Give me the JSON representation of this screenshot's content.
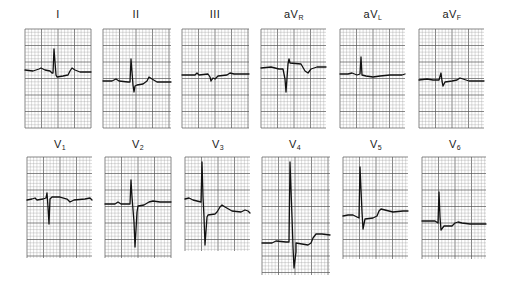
{
  "figure": {
    "colors": {
      "background": "#ffffff",
      "grid_minor": "#9a9a9a",
      "grid_major": "#555555",
      "trace": "#111111"
    },
    "grid": {
      "small_square_px": 3.3,
      "major_every": 5
    }
  },
  "leads": [
    {
      "id": "I",
      "label": "I",
      "sub": "",
      "x": 25,
      "y": 29,
      "w": 66,
      "h": 99,
      "label_x": 28,
      "label_y": 8,
      "trace": [
        [
          0,
          41
        ],
        [
          8,
          42
        ],
        [
          14,
          40
        ],
        [
          16,
          39
        ],
        [
          20,
          41
        ],
        [
          25,
          42
        ],
        [
          27,
          44
        ],
        [
          28,
          44
        ],
        [
          29,
          20
        ],
        [
          31,
          46
        ],
        [
          32,
          48
        ],
        [
          38,
          47
        ],
        [
          43,
          46
        ],
        [
          45,
          42
        ],
        [
          47,
          39
        ],
        [
          50,
          41
        ],
        [
          55,
          43
        ],
        [
          66,
          43
        ]
      ]
    },
    {
      "id": "II",
      "label": "II",
      "sub": "",
      "x": 103,
      "y": 29,
      "w": 68,
      "h": 99,
      "label_x": 106,
      "label_y": 8,
      "trace": [
        [
          0,
          52
        ],
        [
          9,
          52
        ],
        [
          13,
          50
        ],
        [
          16,
          52
        ],
        [
          25,
          53
        ],
        [
          27,
          53
        ],
        [
          28,
          30
        ],
        [
          30,
          56
        ],
        [
          31,
          63
        ],
        [
          32,
          57
        ],
        [
          34,
          56
        ],
        [
          40,
          55
        ],
        [
          44,
          52
        ],
        [
          46,
          48
        ],
        [
          49,
          50
        ],
        [
          54,
          53
        ],
        [
          68,
          53
        ]
      ]
    },
    {
      "id": "III",
      "label": "III",
      "sub": "",
      "x": 182,
      "y": 29,
      "w": 67,
      "h": 99,
      "label_x": 185,
      "label_y": 8,
      "trace": [
        [
          0,
          46
        ],
        [
          13,
          46
        ],
        [
          15,
          44
        ],
        [
          17,
          46
        ],
        [
          26,
          45
        ],
        [
          28,
          48
        ],
        [
          29,
          52
        ],
        [
          31,
          49
        ],
        [
          33,
          50
        ],
        [
          36,
          47
        ],
        [
          45,
          46
        ],
        [
          48,
          44
        ],
        [
          52,
          45
        ],
        [
          67,
          45
        ]
      ]
    },
    {
      "id": "aVR",
      "label": "aV",
      "sub": "R",
      "x": 261,
      "y": 29,
      "w": 65,
      "h": 99,
      "label_x": 264,
      "label_y": 8,
      "trace": [
        [
          0,
          39
        ],
        [
          10,
          38
        ],
        [
          14,
          39
        ],
        [
          18,
          40
        ],
        [
          22,
          40
        ],
        [
          24,
          50
        ],
        [
          25,
          63
        ],
        [
          27,
          35
        ],
        [
          28,
          30
        ],
        [
          29,
          34
        ],
        [
          40,
          35
        ],
        [
          44,
          42
        ],
        [
          47,
          44
        ],
        [
          50,
          40
        ],
        [
          56,
          38
        ],
        [
          65,
          38
        ]
      ]
    },
    {
      "id": "aVL",
      "label": "aV",
      "sub": "L",
      "x": 340,
      "y": 29,
      "w": 65,
      "h": 99,
      "label_x": 343,
      "label_y": 8,
      "trace": [
        [
          0,
          45
        ],
        [
          8,
          45
        ],
        [
          12,
          44
        ],
        [
          17,
          46
        ],
        [
          20,
          45
        ],
        [
          21,
          28
        ],
        [
          22,
          46
        ],
        [
          26,
          47
        ],
        [
          33,
          48
        ],
        [
          40,
          47
        ],
        [
          50,
          46
        ],
        [
          62,
          46
        ],
        [
          65,
          45
        ]
      ]
    },
    {
      "id": "aVF",
      "label": "aV",
      "sub": "F",
      "x": 419,
      "y": 29,
      "w": 65,
      "h": 99,
      "label_x": 422,
      "label_y": 8,
      "trace": [
        [
          0,
          51
        ],
        [
          8,
          50
        ],
        [
          14,
          51
        ],
        [
          20,
          51
        ],
        [
          22,
          44
        ],
        [
          23,
          52
        ],
        [
          24,
          57
        ],
        [
          26,
          53
        ],
        [
          33,
          52
        ],
        [
          38,
          51
        ],
        [
          41,
          49
        ],
        [
          44,
          50
        ],
        [
          50,
          52
        ],
        [
          65,
          52
        ]
      ]
    },
    {
      "id": "V1",
      "label": "V",
      "sub": "1",
      "x": 27,
      "y": 157,
      "w": 65,
      "h": 101,
      "label_x": 30,
      "label_y": 138,
      "trace": [
        [
          0,
          43
        ],
        [
          5,
          42
        ],
        [
          8,
          41
        ],
        [
          10,
          43
        ],
        [
          16,
          42
        ],
        [
          19,
          41
        ],
        [
          20,
          36
        ],
        [
          21,
          50
        ],
        [
          22,
          67
        ],
        [
          23,
          42
        ],
        [
          25,
          40
        ],
        [
          33,
          40
        ],
        [
          40,
          42
        ],
        [
          43,
          45
        ],
        [
          47,
          43
        ],
        [
          58,
          42
        ],
        [
          63,
          41
        ],
        [
          65,
          43
        ]
      ]
    },
    {
      "id": "V2",
      "label": "V",
      "sub": "2",
      "x": 105,
      "y": 157,
      "w": 66,
      "h": 101,
      "label_x": 108,
      "label_y": 138,
      "trace": [
        [
          0,
          47
        ],
        [
          10,
          47
        ],
        [
          13,
          45
        ],
        [
          16,
          47
        ],
        [
          25,
          47
        ],
        [
          26,
          23
        ],
        [
          27,
          40
        ],
        [
          29,
          65
        ],
        [
          30,
          90
        ],
        [
          32,
          55
        ],
        [
          33,
          49
        ],
        [
          39,
          48
        ],
        [
          44,
          45
        ],
        [
          48,
          44
        ],
        [
          55,
          45
        ],
        [
          66,
          45
        ]
      ]
    },
    {
      "id": "V3",
      "label": "V",
      "sub": "3",
      "x": 185,
      "y": 157,
      "w": 65,
      "h": 94,
      "label_x": 188,
      "label_y": 138,
      "trace": [
        [
          0,
          42
        ],
        [
          4,
          41
        ],
        [
          8,
          43
        ],
        [
          16,
          45
        ],
        [
          17,
          5
        ],
        [
          18,
          40
        ],
        [
          19,
          60
        ],
        [
          20,
          88
        ],
        [
          22,
          60
        ],
        [
          23,
          58
        ],
        [
          30,
          57
        ],
        [
          32,
          55
        ],
        [
          35,
          50
        ],
        [
          37,
          48
        ],
        [
          40,
          50
        ],
        [
          47,
          54
        ],
        [
          56,
          55
        ],
        [
          60,
          53
        ],
        [
          63,
          54
        ],
        [
          65,
          56
        ]
      ]
    },
    {
      "id": "V4",
      "label": "V",
      "sub": "4",
      "x": 262,
      "y": 157,
      "w": 68,
      "h": 118,
      "label_x": 265,
      "label_y": 138,
      "trace": [
        [
          0,
          86
        ],
        [
          10,
          86
        ],
        [
          14,
          84
        ],
        [
          24,
          85
        ],
        [
          27,
          85
        ],
        [
          28,
          5
        ],
        [
          30,
          60
        ],
        [
          31,
          90
        ],
        [
          32,
          111
        ],
        [
          34,
          95
        ],
        [
          34,
          86
        ],
        [
          40,
          87
        ],
        [
          46,
          88
        ],
        [
          49,
          86
        ],
        [
          51,
          81
        ],
        [
          54,
          77
        ],
        [
          60,
          77
        ],
        [
          68,
          78
        ]
      ]
    },
    {
      "id": "V5",
      "label": "V",
      "sub": "5",
      "x": 343,
      "y": 157,
      "w": 65,
      "h": 102,
      "label_x": 346,
      "label_y": 138,
      "trace": [
        [
          0,
          59
        ],
        [
          5,
          58
        ],
        [
          10,
          58
        ],
        [
          16,
          61
        ],
        [
          17,
          10
        ],
        [
          19,
          55
        ],
        [
          20,
          72
        ],
        [
          22,
          62
        ],
        [
          30,
          61
        ],
        [
          34,
          59
        ],
        [
          36,
          54
        ],
        [
          38,
          52
        ],
        [
          42,
          53
        ],
        [
          50,
          55
        ],
        [
          60,
          54
        ],
        [
          65,
          54
        ]
      ]
    },
    {
      "id": "V6",
      "label": "V",
      "sub": "6",
      "x": 422,
      "y": 157,
      "w": 64,
      "h": 102,
      "label_x": 425,
      "label_y": 138,
      "trace": [
        [
          0,
          64
        ],
        [
          8,
          64
        ],
        [
          13,
          64
        ],
        [
          16,
          66
        ],
        [
          17,
          35
        ],
        [
          18,
          60
        ],
        [
          19,
          73
        ],
        [
          22,
          69
        ],
        [
          30,
          69
        ],
        [
          33,
          66
        ],
        [
          36,
          65
        ],
        [
          40,
          66
        ],
        [
          48,
          67
        ],
        [
          58,
          67
        ],
        [
          64,
          67
        ]
      ]
    }
  ]
}
